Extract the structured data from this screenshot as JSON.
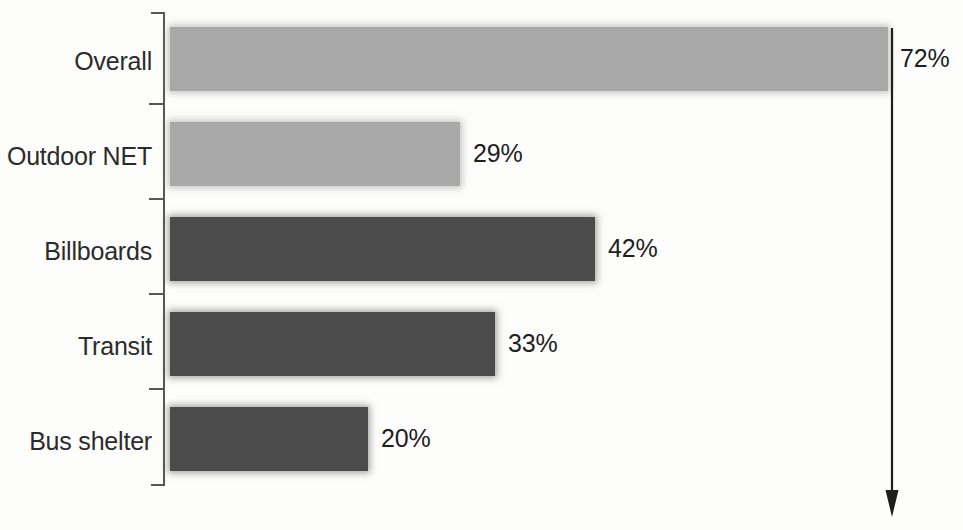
{
  "chart_data": {
    "type": "bar",
    "orientation": "horizontal",
    "title": "",
    "subtitle": "",
    "xlabel": "",
    "ylabel": "",
    "categories": [
      "Overall",
      "Outdoor NET",
      "Billboards",
      "Transit",
      "Bus shelter"
    ],
    "values": [
      72,
      29,
      42,
      33,
      20
    ],
    "value_labels": [
      "72%",
      "29%",
      "42%",
      "33%",
      "20%"
    ],
    "xlim": [
      0,
      72
    ],
    "grid": false,
    "legend": "none",
    "series": [
      {
        "name": "Percent",
        "values": [
          72,
          29,
          42,
          33,
          20
        ]
      }
    ],
    "bar_colors": [
      "#a8a8a8",
      "#a8a8a8",
      "#4b4b4b",
      "#4b4b4b",
      "#4b4b4b"
    ],
    "annotations": [
      {
        "name": "reference-arrow",
        "description": "downward arrow aligned to the Overall bar end",
        "at_value": 72
      }
    ],
    "colors": {
      "light_bar": "#a8a8a8",
      "dark_bar": "#4b4b4b",
      "axis": "#575757",
      "text": "#2b2b2b",
      "background": "#fdfdfc"
    }
  },
  "bars": [
    {
      "label": "Overall",
      "value_label": "72%",
      "top": 27,
      "width": 718,
      "label_x": 900,
      "label_y": 46,
      "tone": "light"
    },
    {
      "label": "Outdoor NET",
      "value_label": "29%",
      "top": 122,
      "width": 290,
      "label_x": 473,
      "label_y": 141,
      "tone": "light"
    },
    {
      "label": "Billboards",
      "value_label": "42%",
      "top": 217,
      "width": 425,
      "label_x": 608,
      "label_y": 236,
      "tone": "dark"
    },
    {
      "label": "Transit",
      "value_label": "33%",
      "top": 312,
      "width": 325,
      "label_x": 508,
      "label_y": 331,
      "tone": "dark"
    },
    {
      "label": "Bus shelter",
      "value_label": "20%",
      "top": 407,
      "width": 198,
      "label_x": 381,
      "label_y": 426,
      "tone": "dark"
    }
  ],
  "axis": {
    "ticks": [
      103,
      198,
      293,
      388
    ]
  }
}
